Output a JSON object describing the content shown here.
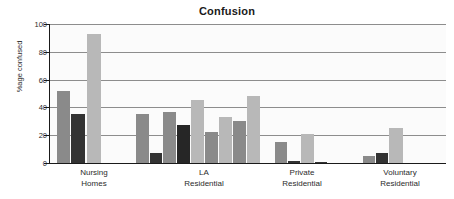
{
  "chart_data": {
    "type": "bar",
    "title": "Confusion",
    "xlabel": "",
    "ylabel": "%age confused",
    "ylim": [
      0,
      100
    ],
    "yticks": [
      0,
      20,
      40,
      60,
      80,
      100
    ],
    "grid": true,
    "legend": "none",
    "categories": [
      "Nursing Homes",
      "LA Residential",
      "Private Residential",
      "Voluntary Residential"
    ],
    "category_labels": [
      {
        "line1": "Nursing",
        "line2": "Homes"
      },
      {
        "line1": "LA",
        "line2": "Residential"
      },
      {
        "line1": "Private",
        "line2": "Residential"
      },
      {
        "line1": "Voluntary",
        "line2": "Residential"
      }
    ],
    "colors": {
      "medium_gray": "#8a8a8a",
      "dark_gray": "#333333",
      "light_gray": "#b8b8b8"
    },
    "groups": [
      {
        "name": "Nursing Homes",
        "bars": [
          {
            "value": 52,
            "color": "#8a8a8a"
          },
          {
            "value": 35,
            "color": "#333333"
          },
          {
            "value": 93,
            "color": "#b8b8b8"
          }
        ]
      },
      {
        "name": "LA Residential",
        "bars": [
          {
            "value": 35,
            "color": "#8a8a8a"
          },
          {
            "value": 7,
            "color": "#333333"
          },
          {
            "value": 37,
            "color": "#8a8a8a"
          },
          {
            "value": 27,
            "color": "#262626"
          },
          {
            "value": 45,
            "color": "#b8b8b8"
          },
          {
            "value": 22,
            "color": "#8a8a8a"
          },
          {
            "value": 33,
            "color": "#b8b8b8"
          },
          {
            "value": 30,
            "color": "#8a8a8a"
          },
          {
            "value": 48,
            "color": "#b8b8b8"
          }
        ]
      },
      {
        "name": "Private Residential",
        "bars": [
          {
            "value": 15,
            "color": "#8a8a8a"
          },
          {
            "value": 1.5,
            "color": "#333333"
          },
          {
            "value": 21,
            "color": "#b8b8b8"
          },
          {
            "value": 1,
            "color": "#333333"
          }
        ]
      },
      {
        "name": "Voluntary Residential",
        "bars": [
          {
            "value": 5,
            "color": "#8a8a8a"
          },
          {
            "value": 7.5,
            "color": "#333333"
          },
          {
            "value": 25,
            "color": "#b8b8b8"
          }
        ]
      }
    ],
    "bar_layout": [
      {
        "group": 0,
        "x": 7,
        "w": 13,
        "value": 52,
        "color": "#8a8a8a"
      },
      {
        "group": 0,
        "x": 21,
        "w": 14,
        "value": 35,
        "color": "#333333"
      },
      {
        "group": 0,
        "x": 37,
        "w": 14,
        "value": 93,
        "color": "#b8b8b8"
      },
      {
        "group": 1,
        "x": 86,
        "w": 13,
        "value": 35,
        "color": "#8a8a8a"
      },
      {
        "group": 1,
        "x": 100,
        "w": 12,
        "value": 7,
        "color": "#333333"
      },
      {
        "group": 1,
        "x": 113,
        "w": 13,
        "value": 37,
        "color": "#8a8a8a"
      },
      {
        "group": 1,
        "x": 127,
        "w": 13,
        "value": 27,
        "color": "#262626"
      },
      {
        "group": 1,
        "x": 141,
        "w": 13,
        "value": 45,
        "color": "#b8b8b8"
      },
      {
        "group": 1,
        "x": 155,
        "w": 13,
        "value": 22,
        "color": "#8a8a8a"
      },
      {
        "group": 1,
        "x": 169,
        "w": 13,
        "value": 33,
        "color": "#b8b8b8"
      },
      {
        "group": 1,
        "x": 183,
        "w": 13,
        "value": 30,
        "color": "#8a8a8a"
      },
      {
        "group": 1,
        "x": 197,
        "w": 13,
        "value": 48,
        "color": "#b8b8b8"
      },
      {
        "group": 2,
        "x": 225,
        "w": 12,
        "value": 15,
        "color": "#8a8a8a"
      },
      {
        "group": 2,
        "x": 238,
        "w": 12,
        "value": 1.5,
        "color": "#333333"
      },
      {
        "group": 2,
        "x": 251,
        "w": 13,
        "value": 21,
        "color": "#b8b8b8"
      },
      {
        "group": 2,
        "x": 265,
        "w": 12,
        "value": 1,
        "color": "#333333"
      },
      {
        "group": 3,
        "x": 313,
        "w": 12,
        "value": 5,
        "color": "#8a8a8a"
      },
      {
        "group": 3,
        "x": 326,
        "w": 12,
        "value": 7.5,
        "color": "#333333"
      },
      {
        "group": 3,
        "x": 339,
        "w": 14,
        "value": 25,
        "color": "#b8b8b8"
      }
    ],
    "group_label_x": [
      44,
      154,
      252,
      350
    ]
  }
}
